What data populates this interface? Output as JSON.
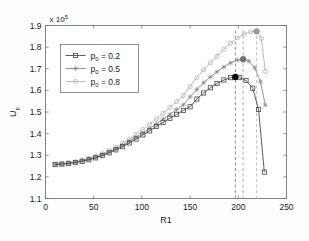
{
  "chart_data": {
    "type": "line",
    "title": "",
    "xlabel": "R1",
    "ylabel": "U_p",
    "ylabel_base": "U",
    "ylabel_sub": "p",
    "y_multiplier": "x 10",
    "y_multiplier_exp": "5",
    "xlim": [
      0,
      250
    ],
    "ylim": [
      1.1,
      1.9
    ],
    "xticks": [
      0,
      50,
      100,
      150,
      200,
      250
    ],
    "yticks": [
      1.1,
      1.2,
      1.3,
      1.4,
      1.5,
      1.6,
      1.7,
      1.8,
      1.9
    ],
    "grid": false,
    "legend_position": "upper-left",
    "y_unit_scale": 100000,
    "series": [
      {
        "name": "p_0 = 0.2",
        "legend_label_base": "p",
        "legend_label_sub": "0",
        "legend_label_rest": " = 0.2",
        "marker": "square",
        "color": "#4a4a4a",
        "peak_x": 197,
        "peak_y": 1.662,
        "x": [
          10,
          17,
          24,
          31,
          38,
          45,
          52,
          59,
          66,
          73,
          80,
          87,
          94,
          101,
          108,
          115,
          122,
          129,
          136,
          143,
          150,
          157,
          164,
          171,
          178,
          185,
          192,
          197,
          201,
          208,
          215,
          221,
          227
        ],
        "y": [
          1.257,
          1.259,
          1.262,
          1.266,
          1.272,
          1.279,
          1.288,
          1.299,
          1.311,
          1.325,
          1.34,
          1.357,
          1.375,
          1.394,
          1.413,
          1.433,
          1.452,
          1.471,
          1.489,
          1.507,
          1.524,
          1.56,
          1.588,
          1.612,
          1.632,
          1.648,
          1.659,
          1.662,
          1.659,
          1.646,
          1.61,
          1.512,
          1.222
        ]
      },
      {
        "name": "p_0 = 0.5",
        "legend_label_base": "p",
        "legend_label_sub": "0",
        "legend_label_rest": " = 0.5",
        "marker": "asterisk",
        "color": "#8a8a8a",
        "peak_x": 205,
        "peak_y": 1.744,
        "x": [
          10,
          17,
          24,
          31,
          38,
          45,
          52,
          59,
          66,
          73,
          80,
          87,
          94,
          101,
          108,
          115,
          122,
          129,
          136,
          143,
          150,
          157,
          164,
          171,
          178,
          185,
          192,
          199,
          205,
          211,
          217,
          223,
          228
        ],
        "y": [
          1.258,
          1.26,
          1.263,
          1.268,
          1.274,
          1.282,
          1.291,
          1.302,
          1.315,
          1.33,
          1.346,
          1.364,
          1.383,
          1.403,
          1.424,
          1.445,
          1.467,
          1.489,
          1.511,
          1.533,
          1.57,
          1.604,
          1.635,
          1.662,
          1.686,
          1.708,
          1.727,
          1.74,
          1.744,
          1.735,
          1.705,
          1.64,
          1.532
        ]
      },
      {
        "name": "p_0 = 0.8",
        "legend_label_base": "p",
        "legend_label_sub": "0",
        "legend_label_rest": " = 0.8",
        "marker": "circle",
        "color": "#b4b4b4",
        "peak_x": 219,
        "peak_y": 1.873,
        "x": [
          10,
          17,
          24,
          31,
          38,
          45,
          52,
          59,
          66,
          73,
          80,
          87,
          94,
          101,
          108,
          115,
          122,
          129,
          136,
          143,
          150,
          157,
          164,
          171,
          178,
          185,
          192,
          199,
          206,
          213,
          219,
          224,
          228
        ],
        "y": [
          1.259,
          1.261,
          1.265,
          1.27,
          1.277,
          1.285,
          1.295,
          1.307,
          1.321,
          1.337,
          1.355,
          1.375,
          1.396,
          1.419,
          1.443,
          1.468,
          1.494,
          1.521,
          1.548,
          1.576,
          1.618,
          1.658,
          1.695,
          1.728,
          1.757,
          1.79,
          1.818,
          1.843,
          1.861,
          1.871,
          1.873,
          1.84,
          1.688
        ]
      }
    ],
    "peak_markers": [
      {
        "x": 197,
        "y": 1.662,
        "fill": "#000000"
      },
      {
        "x": 205,
        "y": 1.744,
        "fill": "#707070"
      },
      {
        "x": 219,
        "y": 1.873,
        "fill": "#9a9a9a"
      }
    ],
    "vlines": [
      {
        "x": 197,
        "color": "#707070"
      },
      {
        "x": 205,
        "color": "#9a9a9a"
      },
      {
        "x": 219,
        "color": "#b0b0b0"
      }
    ]
  }
}
